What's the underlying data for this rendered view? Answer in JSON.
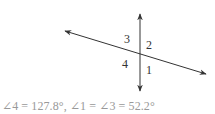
{
  "diagram": {
    "type": "intersecting-lines-angles",
    "angle_labels": [
      {
        "id": "3",
        "text": "3"
      },
      {
        "id": "2",
        "text": "2"
      },
      {
        "id": "4",
        "text": "4"
      },
      {
        "id": "1",
        "text": "1"
      }
    ],
    "colors": {
      "lines": "#333333",
      "caption": "#999999"
    }
  },
  "caption": {
    "text": "∠4 = 127.8°, ∠1 = ∠3 = 52.2°"
  }
}
